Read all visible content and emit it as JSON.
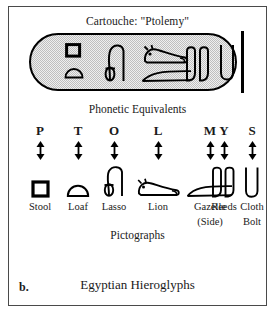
{
  "figure": {
    "panel_letter": "b.",
    "title": "Cartouche:  \"Ptolemy\"",
    "bottom_caption": "Egyptian  Hieroglyphs",
    "phonetic_heading": "Phonetic  Equivalents",
    "pictographs_heading": "Pictographs",
    "cartouche_fill": "#bfbfbf",
    "ink_color": "#000000",
    "frame_color": "#4a4a4a"
  },
  "columns": [
    {
      "letter": "P",
      "name": "Stool",
      "name2": "",
      "glyph": "stool-glyph"
    },
    {
      "letter": "T",
      "name": "Loaf",
      "name2": "",
      "glyph": "loaf-glyph"
    },
    {
      "letter": "O",
      "name": "Lasso",
      "name2": "",
      "glyph": "lasso-glyph"
    },
    {
      "letter": "L",
      "name": "Lion",
      "name2": "",
      "glyph": "lion-glyph"
    },
    {
      "letter": "M",
      "name": "Gazelle",
      "name2": "(Side)",
      "glyph": "gazelle-glyph"
    },
    {
      "letter": "Y",
      "name": "Reeds",
      "name2": "",
      "glyph": "reeds-glyph"
    },
    {
      "letter": "S",
      "name": "Cloth",
      "name2": "Bolt",
      "glyph": "cloth-bolt-glyph"
    }
  ],
  "cartouche_glyphs": [
    {
      "name": "stool-glyph",
      "reads": "P"
    },
    {
      "name": "loaf-glyph",
      "reads": "T"
    },
    {
      "name": "lasso-glyph",
      "reads": "O"
    },
    {
      "name": "lion-glyph",
      "reads": "L"
    },
    {
      "name": "gazelle-glyph",
      "reads": "M"
    },
    {
      "name": "reeds-glyph",
      "reads": "Y"
    },
    {
      "name": "cloth-bolt-glyph",
      "reads": "S"
    }
  ]
}
